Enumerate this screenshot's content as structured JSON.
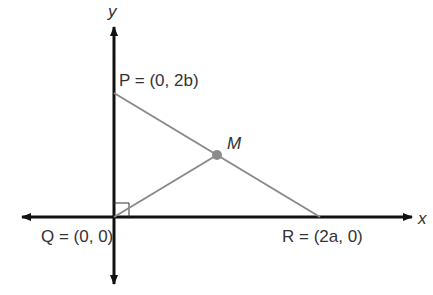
{
  "diagram": {
    "axes": {
      "x_label": "x",
      "y_label": "y"
    },
    "points": [
      {
        "id": "P",
        "name": "P",
        "coords": "(0, 2b)",
        "label": "P = (0, 2b)"
      },
      {
        "id": "Q",
        "name": "Q",
        "coords": "(0, 0)",
        "label": "Q = (0, 0)"
      },
      {
        "id": "R",
        "name": "R",
        "coords": "(2a, 0)",
        "label": "R = (2a, 0)"
      },
      {
        "id": "M",
        "name": "M",
        "label": "M",
        "note": "midpoint of PR"
      }
    ],
    "segments": [
      "PR",
      "QM"
    ],
    "right_angle_at": "Q",
    "colors": {
      "axis": "#111111",
      "segment": "#8a8a8a",
      "point": "#8c8c8c",
      "text": "#333333"
    }
  }
}
